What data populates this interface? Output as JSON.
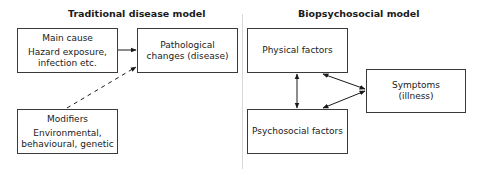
{
  "left_panel": {
    "title": "Traditional disease model",
    "main_cause": {
      "heading": "Main cause",
      "line1": "Hazard exposure,",
      "line2": "infection etc."
    },
    "pathological": {
      "line1": "Pathological",
      "line2": "changes (disease)"
    },
    "modifiers": {
      "heading": "Modifiers",
      "line1": "Environmental,",
      "line2": "behavioural, genetic"
    }
  },
  "right_panel": {
    "title": "Biopsychosocial model",
    "physical": {
      "label": "Physical factors"
    },
    "psychosocial": {
      "label": "Psychosocial factors"
    },
    "symptoms": {
      "line1": "Symptoms",
      "line2": "(illness)"
    }
  },
  "colors": {
    "line": "#1a1a1a",
    "divider": "#d8d8d8",
    "box_border": "#3a3a3a"
  },
  "connections": [
    {
      "from": "main_cause",
      "to": "pathological",
      "style": "solid",
      "direction": "forward"
    },
    {
      "from": "modifiers",
      "to": "pathological",
      "style": "dashed",
      "direction": "forward"
    },
    {
      "from": "physical",
      "to": "psychosocial",
      "style": "solid",
      "direction": "both"
    },
    {
      "from": "physical",
      "to": "symptoms",
      "style": "solid",
      "direction": "both"
    },
    {
      "from": "psychosocial",
      "to": "symptoms",
      "style": "solid",
      "direction": "both"
    }
  ]
}
